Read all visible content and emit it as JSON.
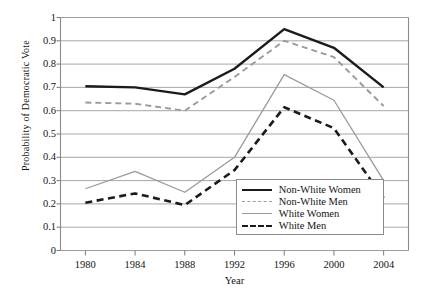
{
  "chart_data": {
    "type": "line",
    "title": "",
    "xlabel": "Year",
    "ylabel": "Probability of Democratic Vote",
    "x": [
      1980,
      1984,
      1988,
      1992,
      1996,
      2000,
      2004
    ],
    "xticklabels": [
      "1980",
      "1984",
      "1988",
      "1992",
      "1996",
      "2000",
      "2004"
    ],
    "yticklabels": [
      "0",
      "0.1",
      "0.2",
      "0.3",
      "0.4",
      "0.5",
      "0.6",
      "0.7",
      "0.8",
      "0.9",
      "1"
    ],
    "ylim": [
      0,
      1
    ],
    "xlim": [
      1978,
      2006
    ],
    "ytick_step": 0.1,
    "grid": "horizontal",
    "legend_position": "lower-right-inside",
    "series": [
      {
        "name": "Non-White Women",
        "values": [
          0.705,
          0.7,
          0.67,
          0.78,
          0.95,
          0.87,
          0.7
        ],
        "style": "solid",
        "color": "#1b1b1b",
        "width": 2.4
      },
      {
        "name": "Non-White Men",
        "values": [
          0.635,
          0.63,
          0.6,
          0.745,
          0.9,
          0.83,
          0.62
        ],
        "style": "dashed",
        "color": "#9a9a9a",
        "width": 1.9
      },
      {
        "name": "White Women",
        "values": [
          0.265,
          0.34,
          0.25,
          0.4,
          0.755,
          0.645,
          0.3
        ],
        "style": "solid",
        "color": "#9a9a9a",
        "width": 1.3
      },
      {
        "name": "White Men",
        "values": [
          0.205,
          0.245,
          0.195,
          0.345,
          0.615,
          0.525,
          0.225
        ],
        "style": "dashed",
        "color": "#1b1b1b",
        "width": 2.6
      }
    ]
  },
  "axes": {
    "frame_color": "#8b8b8b",
    "grid_color": "#9d9d9d",
    "tick_color": "#7a7a7a"
  },
  "legend": {
    "entries": [
      {
        "label": "Non-White Women",
        "swatch": "sw-solid-black"
      },
      {
        "label": "Non-White Men",
        "swatch": "sw-dash-gray"
      },
      {
        "label": "White Women",
        "swatch": "sw-solid-gray"
      },
      {
        "label": "White Men",
        "swatch": "sw-dash-black"
      }
    ]
  }
}
